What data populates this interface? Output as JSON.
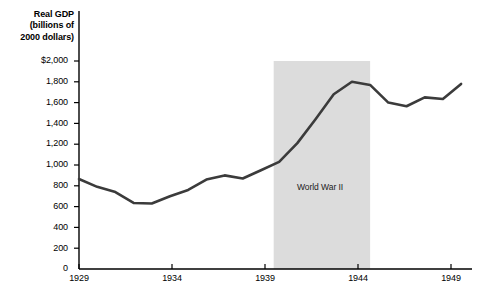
{
  "chart_data": {
    "type": "line",
    "title": "Real GDP (billions of 2000 dollars)",
    "title_lines": [
      "Real GDP",
      "(billions of",
      "2000 dollars)"
    ],
    "xlabel": "",
    "ylabel": "Real GDP (billions of 2000 dollars)",
    "xlim": [
      1929,
      1950.6
    ],
    "ylim": [
      0,
      2000
    ],
    "grid": false,
    "legend": "none",
    "x": [
      1929,
      1930,
      1931,
      1932,
      1933,
      1934,
      1935,
      1936,
      1937,
      1938,
      1939,
      1940,
      1941,
      1942,
      1943,
      1944,
      1945,
      1946,
      1947,
      1948,
      1949,
      1950
    ],
    "values": [
      865,
      790,
      740,
      635,
      630,
      700,
      760,
      860,
      900,
      870,
      950,
      1030,
      1210,
      1440,
      1680,
      1800,
      1770,
      1600,
      1565,
      1650,
      1635,
      1780
    ],
    "series": [
      {
        "name": "Real GDP",
        "color": "#3b3b3b",
        "values": [
          865,
          790,
          740,
          635,
          630,
          700,
          760,
          860,
          900,
          870,
          950,
          1030,
          1210,
          1440,
          1680,
          1800,
          1770,
          1600,
          1565,
          1650,
          1635,
          1780
        ]
      }
    ],
    "ytick_labels": [
      "$2,000",
      "1,800",
      "1,600",
      "1,400",
      "1,200",
      "1,000",
      "800",
      "600",
      "400",
      "200",
      "0"
    ],
    "ytick_values": [
      2000,
      1800,
      1600,
      1400,
      1200,
      1000,
      800,
      600,
      400,
      200,
      0
    ],
    "xtick_labels": [
      "1929",
      "1934",
      "1939",
      "1944",
      "1949"
    ],
    "xtick_values": [
      1929,
      1934,
      1939,
      1944,
      1949
    ],
    "annotations": [
      {
        "label": "World War II",
        "type": "shaded-band",
        "x_start": 1939.7,
        "x_end": 1945.0,
        "y_top": 2000,
        "color": "#dcdcdc"
      }
    ],
    "colors": {
      "line": "#3b3b3b",
      "axis": "#000000",
      "band": "#dcdcdc",
      "background": "#ffffff",
      "text": "#000000"
    }
  }
}
